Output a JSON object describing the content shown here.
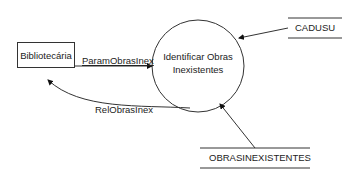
{
  "diagram": {
    "type": "data-flow-diagram",
    "external_entity": {
      "label": "Bibliotecária"
    },
    "process": {
      "line1": "Identificar Obras",
      "line2": "Inexistentes"
    },
    "data_stores": [
      {
        "label": "CADUSU"
      },
      {
        "label": "OBRASINEXISTENTES"
      }
    ],
    "flows": [
      {
        "label": "ParamObrasInex",
        "from": "Bibliotecária",
        "to": "Identificar Obras Inexistentes"
      },
      {
        "label": "RelObrasInex",
        "from": "Identificar Obras Inexistentes",
        "to": "Bibliotecária"
      },
      {
        "label": "",
        "from": "CADUSU",
        "to": "Identificar Obras Inexistentes"
      },
      {
        "label": "",
        "from": "OBRASINEXISTENTES",
        "to": "Identificar Obras Inexistentes"
      }
    ]
  }
}
